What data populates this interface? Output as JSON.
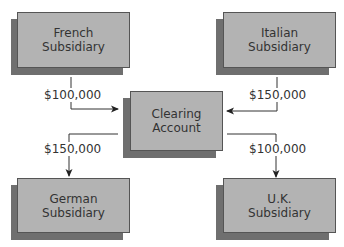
{
  "diagram": {
    "nodes": {
      "french": {
        "label_line1": "French",
        "label_line2": "Subsidiary"
      },
      "italian": {
        "label_line1": "Italian",
        "label_line2": "Subsidiary"
      },
      "clearing": {
        "label_line1": "Clearing",
        "label_line2": "Account"
      },
      "german": {
        "label_line1": "German",
        "label_line2": "Subsidiary"
      },
      "uk": {
        "label_line1": "U.K.",
        "label_line2": "Subsidiary"
      }
    },
    "flows": [
      {
        "from": "French Subsidiary",
        "to": "Clearing Account",
        "amount": "$100,000"
      },
      {
        "from": "Italian Subsidiary",
        "to": "Clearing Account",
        "amount": "$150,000"
      },
      {
        "from": "Clearing Account",
        "to": "German Subsidiary",
        "amount": "$150,000"
      },
      {
        "from": "Clearing Account",
        "to": "U.K. Subsidiary",
        "amount": "$100,000"
      }
    ],
    "colors": {
      "box_face": "#b3b3b3",
      "box_shadow": "#6f6f6f",
      "line": "#333333"
    }
  }
}
